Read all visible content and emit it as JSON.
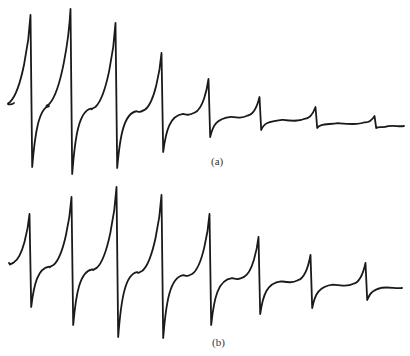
{
  "figure": {
    "panels": [
      {
        "id": "a",
        "label": "(a)"
      },
      {
        "id": "b",
        "label": "(b)"
      }
    ],
    "stroke_color": "#1a1a1a",
    "background": "#ffffff"
  },
  "chart_data": [
    {
      "type": "line",
      "title": "(a)",
      "xlabel": "",
      "ylabel": "",
      "grid": false,
      "legend": null,
      "description": "Derivative-style signal trace: 8 dispersive (up-then-down) resonance lines whose amplitude decays strongly from left to right",
      "baseline_start": [
        14,
        103
      ],
      "baseline_end": [
        404,
        126
      ],
      "peaks": [
        {
          "index": 1,
          "x": 31,
          "max_y": 15,
          "min_y": 167
        },
        {
          "index": 2,
          "x": 71,
          "max_y": 9,
          "min_y": 174
        },
        {
          "index": 3,
          "x": 116,
          "max_y": 23,
          "min_y": 168
        },
        {
          "index": 4,
          "x": 162,
          "max_y": 53,
          "min_y": 152
        },
        {
          "index": 5,
          "x": 209,
          "max_y": 79,
          "min_y": 137
        },
        {
          "index": 6,
          "x": 260,
          "max_y": 97,
          "min_y": 130
        },
        {
          "index": 7,
          "x": 316,
          "max_y": 107,
          "min_y": 128
        },
        {
          "index": 8,
          "x": 375,
          "max_y": 116,
          "min_y": 128
        }
      ],
      "relative_peak_to_peak_amplitudes": [
        152,
        165,
        145,
        99,
        58,
        33,
        21,
        12
      ]
    },
    {
      "type": "line",
      "title": "(b)",
      "xlabel": "",
      "ylabel": "",
      "grid": false,
      "legend": null,
      "description": "Derivative-style signal trace: 8 dispersive resonance lines; amplitude rises to a max at lines 3-4 then decays",
      "baseline_start": [
        9,
        263
      ],
      "baseline_end": [
        402,
        288
      ],
      "peaks": [
        {
          "index": 1,
          "x": 30,
          "max_y": 214,
          "min_y": 307
        },
        {
          "index": 2,
          "x": 72,
          "max_y": 197,
          "min_y": 325
        },
        {
          "index": 3,
          "x": 117,
          "max_y": 187,
          "min_y": 337
        },
        {
          "index": 4,
          "x": 162,
          "max_y": 195,
          "min_y": 338
        },
        {
          "index": 5,
          "x": 210,
          "max_y": 214,
          "min_y": 325
        },
        {
          "index": 6,
          "x": 259,
          "max_y": 237,
          "min_y": 314
        },
        {
          "index": 7,
          "x": 311,
          "max_y": 255,
          "min_y": 308
        },
        {
          "index": 8,
          "x": 366,
          "max_y": 263,
          "min_y": 300
        }
      ],
      "relative_peak_to_peak_amplitudes": [
        93,
        128,
        150,
        143,
        111,
        77,
        53,
        37
      ]
    }
  ]
}
